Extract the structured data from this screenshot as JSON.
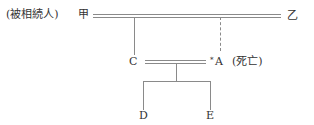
{
  "diagram": {
    "type": "family-tree",
    "nodes": {
      "decedent": {
        "prefix": "(被相続人)",
        "name": "甲"
      },
      "spouse": {
        "name": "乙"
      },
      "child_c": {
        "name": "C"
      },
      "child_a": {
        "marker": "*",
        "name": "A",
        "note": "(死亡)"
      },
      "grandchild_d": {
        "name": "D"
      },
      "grandchild_e": {
        "name": "E"
      }
    },
    "relations": [
      {
        "type": "marriage",
        "from": "甲",
        "to": "乙"
      },
      {
        "type": "child",
        "parent": "甲・乙",
        "child": "C",
        "line": "solid"
      },
      {
        "type": "child",
        "parent": "甲・乙",
        "child": "A",
        "line": "dashed"
      },
      {
        "type": "marriage",
        "from": "C",
        "to": "A"
      },
      {
        "type": "child",
        "parent": "C・A",
        "child": "D"
      },
      {
        "type": "child",
        "parent": "C・A",
        "child": "E"
      }
    ]
  }
}
